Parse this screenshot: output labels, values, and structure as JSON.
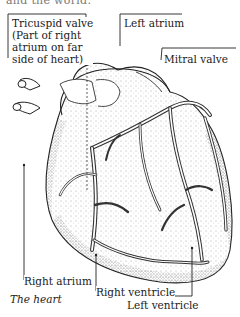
{
  "top_fragment": "and the world.",
  "figure": {
    "caption": "The heart",
    "labels": {
      "tricuspid_valve_1": "Tricuspid valve",
      "tricuspid_valve_2": "(Part of right",
      "tricuspid_valve_3": "atrium on far",
      "tricuspid_valve_4": "side of heart)",
      "left_atrium": "Left atrium",
      "mitral_valve": "Mitral valve",
      "right_atrium": "Right atrium",
      "right_ventricle": "Right ventricle",
      "left_ventricle": "Left ventricle"
    }
  }
}
